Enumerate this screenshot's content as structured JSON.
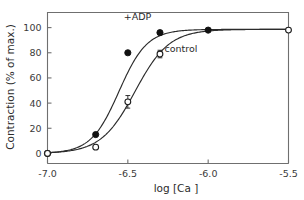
{
  "chart_data": {
    "type": "line",
    "title": "",
    "xlabel": "log [Ca ]",
    "ylabel": "Contraction (% of max.)",
    "xlim": [
      -7.0,
      -5.5
    ],
    "ylim": [
      -8,
      112
    ],
    "xticks": [
      -7.0,
      -6.5,
      -6.0,
      -5.5
    ],
    "xticklabels": [
      "-7.0",
      "-6.5",
      "-6.0",
      "-5.5"
    ],
    "yticks": [
      0,
      20,
      40,
      60,
      80,
      100
    ],
    "yticklabels": [
      "0",
      "20",
      "40",
      "60",
      "80",
      "100"
    ],
    "grid": false,
    "legend_position": "inline-annotation",
    "series": [
      {
        "name": "+ADP",
        "marker": "filled-circle",
        "label_text": "+ADP",
        "x": [
          -7.0,
          -6.7,
          -6.5,
          -6.3,
          -6.0
        ],
        "values": [
          0,
          15,
          80,
          96,
          98
        ],
        "errors": [
          0,
          0,
          0,
          0,
          0
        ]
      },
      {
        "name": "control",
        "marker": "open-circle",
        "label_text": "control",
        "x": [
          -7.0,
          -6.7,
          -6.5,
          -6.3,
          -5.5
        ],
        "values": [
          0,
          5,
          41,
          79,
          98
        ],
        "errors": [
          0,
          0,
          5,
          3,
          0
        ]
      }
    ],
    "annotations": [
      {
        "text": "+ADP",
        "x": -6.44,
        "y": 106
      },
      {
        "text": "control",
        "x": -6.17,
        "y": 81
      }
    ]
  },
  "axis": {
    "x_title": "log [Ca ]",
    "y_title": "Contraction (% of max.)"
  }
}
